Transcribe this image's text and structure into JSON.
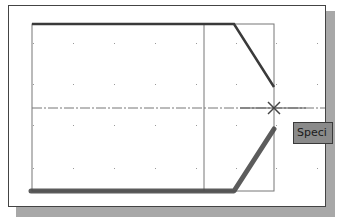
{
  "drawing": {
    "description": "CAD drawing viewport showing a profile with chamfered right end, centerline, grid dots and snap marker",
    "colors": {
      "background": "#ffffff",
      "frame": "#444444",
      "shadow": "#a8a8a8",
      "geometry_thin": "#666666",
      "geometry_thick": "#3a3a3a",
      "highlight": "#555555",
      "grid_dot": "#9a9a9a",
      "tooltip_bg": "#8a8a8a"
    },
    "grid": {
      "x": [
        33,
        73,
        114,
        155,
        196,
        236,
        276,
        317
      ],
      "y": [
        43,
        84,
        125,
        168
      ]
    },
    "centerline_y": 108,
    "snap_marker": {
      "x": 274,
      "y": 108,
      "shape": "x-cross"
    }
  },
  "tooltip": {
    "text": "Speci"
  }
}
